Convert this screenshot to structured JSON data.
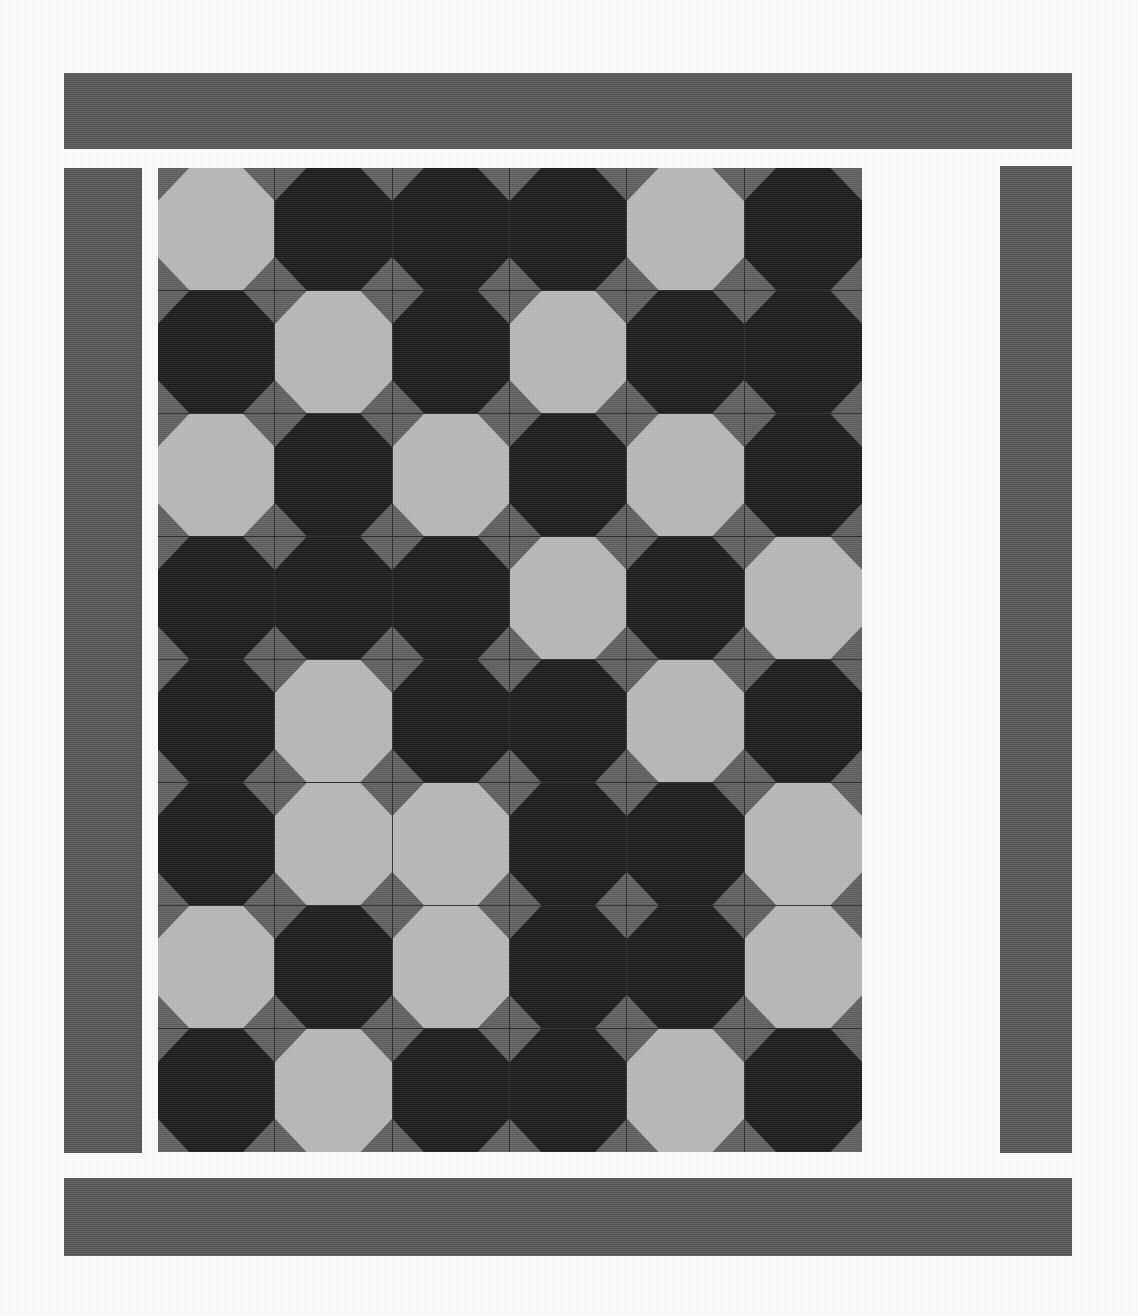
{
  "artwork": {
    "title": "Octagon Patchwork Quilt",
    "medium": "pieced fabric quilt photograph",
    "orientation": "portrait"
  },
  "palette": {
    "light_patch": "#b9b9b9",
    "dark_patch": "#1c1c1c",
    "ground_gray": "#606060",
    "border_gray": "#585858",
    "seam_line": "#2b2b2b",
    "background": "#ffffff"
  },
  "borders": [
    {
      "name": "top",
      "label": "top border strip"
    },
    {
      "name": "left",
      "label": "left border strip"
    },
    {
      "name": "right",
      "label": "right border strip"
    },
    {
      "name": "bottom",
      "label": "bottom border strip"
    }
  ],
  "grid": {
    "columns": 6,
    "rows": 8,
    "block_shape": "octagon",
    "corner_shape": "triangle",
    "cells": [
      [
        "light",
        "dark",
        "dark",
        "dark",
        "light",
        "dark"
      ],
      [
        "dark",
        "light",
        "dark",
        "light",
        "dark",
        "dark"
      ],
      [
        "light",
        "dark",
        "light",
        "dark",
        "light",
        "dark"
      ],
      [
        "dark",
        "dark",
        "dark",
        "light",
        "dark",
        "light"
      ],
      [
        "dark",
        "light",
        "dark",
        "dark",
        "light",
        "dark"
      ],
      [
        "dark",
        "light",
        "light",
        "dark",
        "dark",
        "light"
      ],
      [
        "light",
        "dark",
        "light",
        "dark",
        "dark",
        "light"
      ],
      [
        "dark",
        "light",
        "dark",
        "dark",
        "light",
        "dark"
      ]
    ]
  }
}
